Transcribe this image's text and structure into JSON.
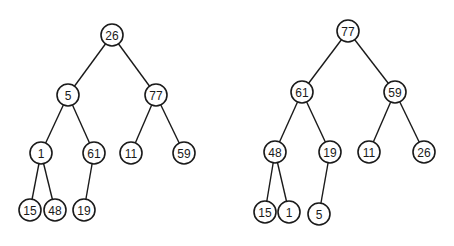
{
  "trees": [
    {
      "name": "original-tree",
      "nodes": [
        {
          "id": "a0",
          "label": "26",
          "x": 112,
          "y": 35
        },
        {
          "id": "a1",
          "label": "5",
          "x": 68,
          "y": 95
        },
        {
          "id": "a2",
          "label": "77",
          "x": 156,
          "y": 95
        },
        {
          "id": "a3",
          "label": "1",
          "x": 41,
          "y": 153
        },
        {
          "id": "a4",
          "label": "61",
          "x": 94,
          "y": 153
        },
        {
          "id": "a5",
          "label": "11",
          "x": 131,
          "y": 153
        },
        {
          "id": "a6",
          "label": "59",
          "x": 184,
          "y": 153
        },
        {
          "id": "a7",
          "label": "15",
          "x": 30,
          "y": 210
        },
        {
          "id": "a8",
          "label": "48",
          "x": 55,
          "y": 210
        },
        {
          "id": "a9",
          "label": "19",
          "x": 84,
          "y": 210
        }
      ],
      "edges": [
        [
          "a0",
          "a1"
        ],
        [
          "a0",
          "a2"
        ],
        [
          "a1",
          "a3"
        ],
        [
          "a1",
          "a4"
        ],
        [
          "a2",
          "a5"
        ],
        [
          "a2",
          "a6"
        ],
        [
          "a3",
          "a7"
        ],
        [
          "a3",
          "a8"
        ],
        [
          "a4",
          "a9"
        ]
      ]
    },
    {
      "name": "heapified-tree",
      "nodes": [
        {
          "id": "b0",
          "label": "77",
          "x": 348,
          "y": 31
        },
        {
          "id": "b1",
          "label": "61",
          "x": 302,
          "y": 92
        },
        {
          "id": "b2",
          "label": "59",
          "x": 395,
          "y": 92
        },
        {
          "id": "b3",
          "label": "48",
          "x": 275,
          "y": 152
        },
        {
          "id": "b4",
          "label": "19",
          "x": 330,
          "y": 152
        },
        {
          "id": "b5",
          "label": "11",
          "x": 369,
          "y": 152
        },
        {
          "id": "b6",
          "label": "26",
          "x": 424,
          "y": 152
        },
        {
          "id": "b7",
          "label": "15",
          "x": 265,
          "y": 212
        },
        {
          "id": "b8",
          "label": "1",
          "x": 289,
          "y": 212
        },
        {
          "id": "b9",
          "label": "5",
          "x": 319,
          "y": 214
        }
      ],
      "edges": [
        [
          "b0",
          "b1"
        ],
        [
          "b0",
          "b2"
        ],
        [
          "b1",
          "b3"
        ],
        [
          "b1",
          "b4"
        ],
        [
          "b2",
          "b5"
        ],
        [
          "b2",
          "b6"
        ],
        [
          "b3",
          "b7"
        ],
        [
          "b3",
          "b8"
        ],
        [
          "b4",
          "b9"
        ]
      ]
    }
  ],
  "style": {
    "node_radius": 11,
    "stroke_color": "#1a1a1a",
    "fill_color": "#ffffff"
  }
}
